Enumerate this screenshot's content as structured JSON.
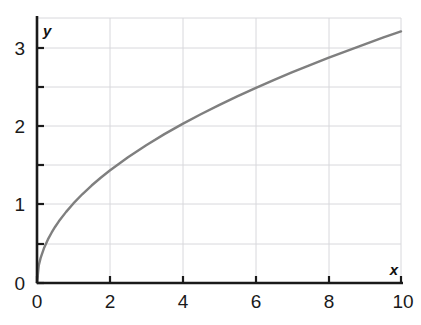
{
  "chart_data": {
    "type": "line",
    "title": "",
    "subtitle": "",
    "xlabel": "x",
    "ylabel": "y",
    "xlim": [
      0,
      10
    ],
    "ylim": [
      0,
      3.33
    ],
    "grid": true,
    "legend": null,
    "series": [
      {
        "name": "sqrt(x)",
        "color": "#7f7f7f",
        "line_width": 2.4,
        "x": [
          0,
          0.05,
          0.1,
          0.2,
          0.3,
          0.4,
          0.5,
          0.6,
          0.8,
          1,
          1.25,
          1.5,
          1.75,
          2,
          2.5,
          3,
          3.5,
          4,
          4.5,
          5,
          5.5,
          6,
          6.5,
          7,
          7.5,
          8,
          8.5,
          9,
          9.5,
          10
        ],
        "y": [
          0,
          0.224,
          0.316,
          0.447,
          0.548,
          0.632,
          0.707,
          0.775,
          0.894,
          1,
          1.118,
          1.225,
          1.323,
          1.414,
          1.581,
          1.732,
          1.871,
          2,
          2.121,
          2.236,
          2.345,
          2.449,
          2.55,
          2.646,
          2.739,
          2.828,
          2.915,
          3,
          3.082,
          3.162
        ]
      }
    ],
    "x_ticks_major": [
      0,
      2,
      4,
      6,
      8,
      10
    ],
    "x_tick_labels": [
      "0",
      "2",
      "4",
      "6",
      "8",
      "10"
    ],
    "y_ticks_major": [
      0,
      1,
      2,
      3
    ],
    "y_tick_labels": [
      "0",
      "1",
      "2",
      "3"
    ],
    "y_ticks_minor": [
      0.5,
      1.5,
      2.5
    ],
    "gridline_color": "#d8d8dc",
    "axis_color": "#1a1a1a",
    "background_color": "#ffffff"
  },
  "axes": {
    "x_axis_label": "x",
    "y_axis_label": "y"
  }
}
